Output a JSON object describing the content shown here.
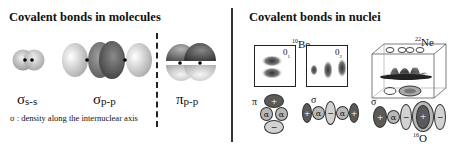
{
  "left_panel": {
    "title": "Covalent bonds in molecules",
    "orbitals": [
      {
        "symbol": "σ",
        "subscript": "s-s"
      },
      {
        "symbol": "σ",
        "subscript": "p-p"
      },
      {
        "symbol": "π",
        "subscript": "p-p"
      }
    ],
    "note": "σ : density along the internuclear axis"
  },
  "right_panel": {
    "title": "Covalent bonds in nuclei",
    "be10": {
      "isotope_mass": "10",
      "isotope_symbol": "Be",
      "state_left": "0",
      "state_left_sub": "1",
      "state_left_sup": "+",
      "state_right": "0",
      "state_right_sub": "2",
      "state_right_sup": "+",
      "pi_label": "π",
      "sigma_label": "σ",
      "pi_cluster": [
        "+",
        "α",
        "α",
        "−"
      ],
      "sigma_chain": [
        "+",
        "α",
        "−",
        "α",
        "+"
      ]
    },
    "ne22": {
      "isotope_mass": "22",
      "isotope_symbol": "Ne",
      "sigma_label": "σ",
      "chain": [
        "+",
        "α",
        "−",
        "+",
        "−"
      ],
      "core_mass": "16",
      "core_symbol": "O"
    }
  },
  "colors": {
    "dark_lobe": "#5a5a5a",
    "mid_lobe": "#b8b8b8",
    "light_lobe": "#d2d2d2",
    "separator": "#333333"
  }
}
